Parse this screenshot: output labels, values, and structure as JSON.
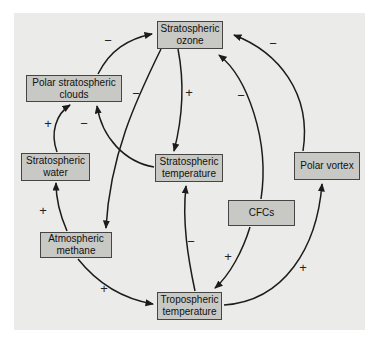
{
  "diagram": {
    "title": "",
    "colors": {
      "panel_background": "#ebebea",
      "node_fill": "#c8c8c5",
      "node_border": "#454545",
      "arrow": "#1c1c1c"
    },
    "nodes": [
      {
        "id": "stratospheric-ozone",
        "label": "Stratospheric ozone"
      },
      {
        "id": "polar-stratospheric-clouds",
        "label": "Polar stratospheric clouds"
      },
      {
        "id": "stratospheric-water",
        "label": "Stratospheric water"
      },
      {
        "id": "stratospheric-temperature",
        "label": "Stratospheric temperature"
      },
      {
        "id": "polar-vortex",
        "label": "Polar vortex"
      },
      {
        "id": "cfcs",
        "label": "CFCs"
      },
      {
        "id": "atmospheric-methane",
        "label": "Atmospheric methane"
      },
      {
        "id": "tropospheric-temperature",
        "label": "Tropospheric temperature"
      }
    ],
    "edges": [
      {
        "from": "polar-stratospheric-clouds",
        "to": "stratospheric-ozone",
        "sign": "−"
      },
      {
        "from": "polar-vortex",
        "to": "stratospheric-ozone",
        "sign": "−"
      },
      {
        "from": "stratospheric-ozone",
        "to": "atmospheric-methane",
        "sign": "−"
      },
      {
        "from": "stratospheric-ozone",
        "to": "stratospheric-temperature",
        "sign": "+"
      },
      {
        "from": "cfcs",
        "to": "stratospheric-ozone",
        "sign": "−"
      },
      {
        "from": "stratospheric-water",
        "to": "polar-stratospheric-clouds",
        "sign": "+"
      },
      {
        "from": "stratospheric-temperature",
        "to": "polar-stratospheric-clouds",
        "sign": "−"
      },
      {
        "from": "atmospheric-methane",
        "to": "stratospheric-water",
        "sign": "+"
      },
      {
        "from": "tropospheric-temperature",
        "to": "stratospheric-temperature",
        "sign": "−"
      },
      {
        "from": "cfcs",
        "to": "tropospheric-temperature",
        "sign": "+"
      },
      {
        "from": "atmospheric-methane",
        "to": "tropospheric-temperature",
        "sign": "+"
      },
      {
        "from": "tropospheric-temperature",
        "to": "polar-vortex",
        "sign": "+"
      }
    ]
  }
}
